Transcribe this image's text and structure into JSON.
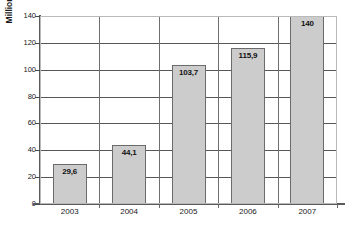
{
  "chart_data": {
    "type": "bar",
    "title": "",
    "subtitle": "",
    "xlabel": "",
    "ylabel": "Millionen",
    "categories": [
      "2003",
      "2004",
      "2005",
      "2006",
      "2007"
    ],
    "values": [
      29.6,
      44.1,
      103.7,
      115.9,
      140
    ],
    "value_labels": [
      "29,6",
      "44,1",
      "103,7",
      "115,9",
      "140"
    ],
    "series": [
      {
        "name": "Millionen",
        "values": [
          29.6,
          44.1,
          103.7,
          115.9,
          140
        ]
      }
    ],
    "ylim": [
      0,
      140
    ],
    "yticks": [
      0,
      20,
      40,
      60,
      80,
      100,
      120,
      140
    ],
    "ytick_labels": [
      "0",
      "20",
      "40",
      "60",
      "80",
      "100",
      "120",
      "140"
    ],
    "xlim_categories": 5,
    "grid": {
      "horizontal": true,
      "vertical": true,
      "color": "#575757"
    },
    "legend": {
      "visible": false,
      "position": "none"
    },
    "colors": {
      "bar_fill": "#cccccc",
      "bar_border": "#6b6b6b",
      "gridline": "#575757",
      "axis": "#5a5a5a",
      "text": "#202020",
      "background": "#ffffff"
    },
    "decimal_separator": ","
  }
}
